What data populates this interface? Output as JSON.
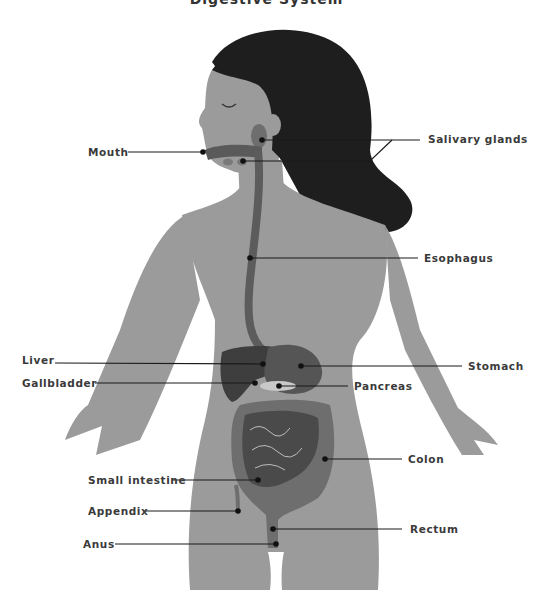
{
  "title": "Digestive System",
  "colors": {
    "background": "#ffffff",
    "body": "#9b9b9b",
    "hair": "#1e1e1e",
    "organ_dark": "#4a4a4a",
    "organ_mid": "#6e6e6e",
    "organ_light": "#c9c9c9",
    "line": "#1a1a1a",
    "text": "#3a3a3a"
  },
  "labels": [
    {
      "id": "mouth",
      "text": "Mouth"
    },
    {
      "id": "salivary-glands",
      "text": "Salivary glands"
    },
    {
      "id": "esophagus",
      "text": "Esophagus"
    },
    {
      "id": "liver",
      "text": "Liver"
    },
    {
      "id": "gallbladder",
      "text": "Gallbladder"
    },
    {
      "id": "stomach",
      "text": "Stomach"
    },
    {
      "id": "pancreas",
      "text": "Pancreas"
    },
    {
      "id": "colon",
      "text": "Colon"
    },
    {
      "id": "small-intestine",
      "text": "Small intestine"
    },
    {
      "id": "appendix",
      "text": "Appendix"
    },
    {
      "id": "rectum",
      "text": "Rectum"
    },
    {
      "id": "anus",
      "text": "Anus"
    }
  ]
}
